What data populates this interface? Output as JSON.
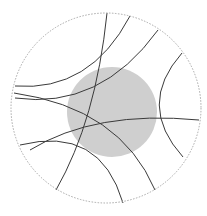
{
  "diagram": {
    "title": "",
    "boundary": {
      "cx": 106,
      "cy": 108,
      "r": 95,
      "stroke": "#a8a8a8"
    },
    "shaded_disk": {
      "cx": 112,
      "cy": 112,
      "r": 45,
      "fill": "#cfcfcf"
    },
    "geodesic_color": "#3a3a3a",
    "geodesics": [
      {
        "id": "a",
        "d": "M107,13 Q96,120 56,190"
      },
      {
        "id": "b",
        "d": "M130,16 Q90,92 15,86"
      },
      {
        "id": "c",
        "d": "M158,30 Q100,110 15,98"
      },
      {
        "id": "d",
        "d": "M182,53 Q136,105 183,157"
      },
      {
        "id": "e",
        "d": "M14,93 Q120,108 155,190"
      },
      {
        "id": "f",
        "d": "M30,150 Q95,110 199,120"
      },
      {
        "id": "g",
        "d": "M20,145 Q100,125 123,203"
      }
    ]
  }
}
